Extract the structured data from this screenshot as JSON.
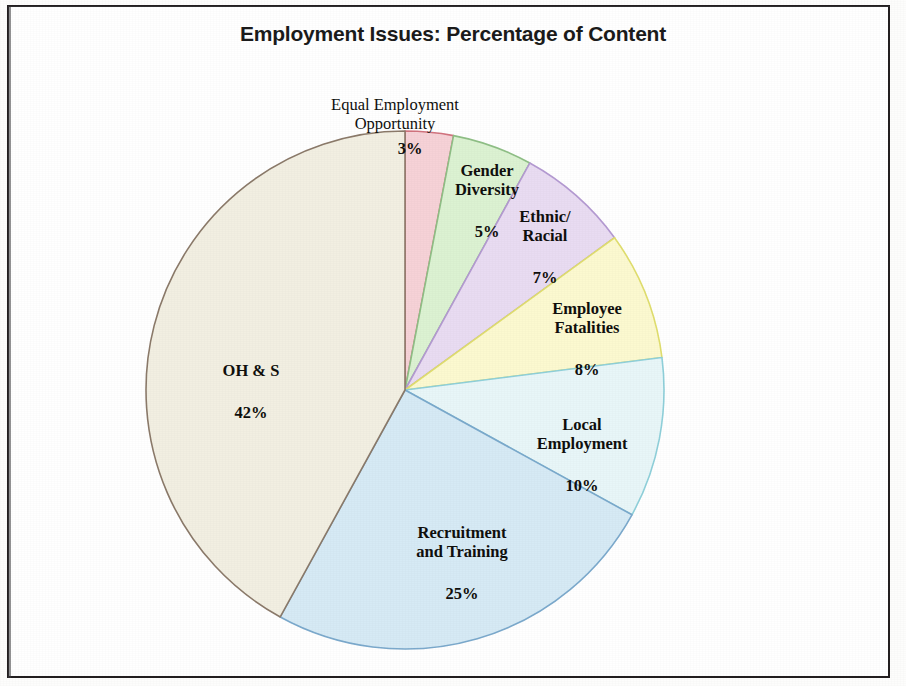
{
  "figure": {
    "title": "Employment Issues: Percentage of Content",
    "background_color": "#ffffff",
    "frame_color": "#231f20"
  },
  "chart_data": {
    "type": "pie",
    "title": "Employment Issues: Percentage of Content",
    "xlabel": "",
    "ylabel": "",
    "units": "percent",
    "start_angle_deg": 0,
    "direction": "clockwise",
    "legend": "none (labels placed on slices)",
    "grid": false,
    "total": 100,
    "categories": [
      "Equal Employment Opportunity",
      "Gender Diversity",
      "Ethnic/ Racial",
      "Employee Fatalities",
      "Local Employment",
      "Recruitment and Training",
      "OH & S"
    ],
    "values": [
      3,
      5,
      7,
      8,
      10,
      25,
      42
    ],
    "value_labels": [
      "3%",
      "5%",
      "7%",
      "8%",
      "10%",
      "25%",
      "42%"
    ],
    "colors": [
      "#f6d2d7",
      "#dcf2d2",
      "#e9dcf2",
      "#fcf9d0",
      "#e8f6f8",
      "#d6eaf5",
      "#f2efe2"
    ],
    "edge_colors": [
      "#d2747f",
      "#8fbf86",
      "#b49ad2",
      "#e0de6e",
      "#8fd0da",
      "#7ba9cc",
      "#8b7a6a"
    ],
    "slices": [
      {
        "label": "Equal Employment\nOpportunity",
        "percent_label": "3%",
        "value": 3,
        "color": "#f6d2d7",
        "edge": "#d2747f"
      },
      {
        "label": "Gender\nDiversity",
        "percent_label": "5%",
        "value": 5,
        "color": "#dcf2d2",
        "edge": "#8fbf86"
      },
      {
        "label": "Ethnic/\nRacial",
        "percent_label": "7%",
        "value": 7,
        "color": "#e9dcf2",
        "edge": "#b49ad2"
      },
      {
        "label": "Employee\nFatalities",
        "percent_label": "8%",
        "value": 8,
        "color": "#fcf9d0",
        "edge": "#e0de6e"
      },
      {
        "label": "Local\nEmployment",
        "percent_label": "10%",
        "value": 10,
        "color": "#e8f6f8",
        "edge": "#8fd0da"
      },
      {
        "label": "Recruitment\nand Training",
        "percent_label": "25%",
        "value": 25,
        "color": "#d6eaf5",
        "edge": "#7ba9cc"
      },
      {
        "label": "OH & S",
        "percent_label": "42%",
        "value": 42,
        "color": "#f2efe2",
        "edge": "#8b7a6a"
      }
    ]
  },
  "labels": {
    "eeo_name": "Equal Employment\nOpportunity",
    "eeo_pct": "3%",
    "gender_name": "Gender\nDiversity",
    "gender_pct": "5%",
    "ethnic_name": "Ethnic/\nRacial",
    "ethnic_pct": "7%",
    "fatalities_name": "Employee\nFatalities",
    "fatalities_pct": "8%",
    "local_name": "Local\nEmployment",
    "local_pct": "10%",
    "recruitment_name": "Recruitment\nand Training",
    "recruitment_pct": "25%",
    "ohs_name": "OH & S",
    "ohs_pct": "42%"
  }
}
